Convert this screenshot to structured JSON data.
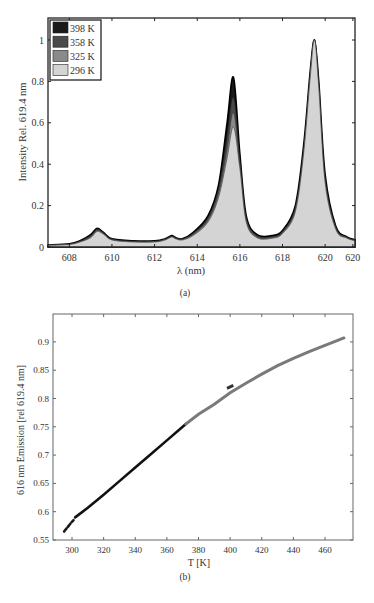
{
  "figure_a": {
    "caption": "(a)",
    "xlabel": "λ (nm)",
    "ylabel": "Intensity Rel. 619.4 nm",
    "xticks": [
      "608",
      "610",
      "612",
      "614",
      "616",
      "618",
      "620",
      "620"
    ],
    "yticks": [
      "0",
      "0.2",
      "0.4",
      "0.6",
      "0.8",
      "1"
    ],
    "legend": [
      {
        "label": "398 K",
        "color": "#1a1a1a"
      },
      {
        "label": "358 K",
        "color": "#4a4a4a"
      },
      {
        "label": "325 K",
        "color": "#8a8a8a"
      },
      {
        "label": "296 K",
        "color": "#d4d4d4"
      }
    ]
  },
  "figure_b": {
    "caption": "(b)",
    "xlabel": "T [K]",
    "ylabel": "616 nm Emission [rel 619.4 nm]",
    "xticks": [
      "300",
      "320",
      "340",
      "360",
      "380",
      "400",
      "420",
      "440",
      "460"
    ],
    "yticks": [
      "0.55",
      "0.6",
      "0.65",
      "0.7",
      "0.75",
      "0.8",
      "0.85",
      "0.9"
    ]
  },
  "chart_data": [
    {
      "type": "area",
      "title": "",
      "xlabel": "λ (nm)",
      "ylabel": "Intensity Rel. 619.4 nm",
      "xlim": [
        607,
        621.4
      ],
      "ylim": [
        0,
        1.1
      ],
      "grid": false,
      "legend_position": "upper-left",
      "x": [
        607,
        608,
        608.5,
        609,
        609.3,
        609.6,
        610,
        611,
        612,
        612.5,
        612.8,
        613,
        613.3,
        613.8,
        614.5,
        615,
        615.4,
        615.7,
        616,
        616.3,
        616.8,
        617.5,
        618,
        618.6,
        619,
        619.3,
        619.5,
        619.7,
        620,
        620.5,
        621,
        621.4
      ],
      "series": [
        {
          "name": "398 K",
          "values": [
            0.01,
            0.015,
            0.03,
            0.06,
            0.09,
            0.07,
            0.04,
            0.03,
            0.03,
            0.04,
            0.055,
            0.045,
            0.04,
            0.07,
            0.15,
            0.3,
            0.6,
            0.82,
            0.45,
            0.15,
            0.06,
            0.055,
            0.08,
            0.2,
            0.5,
            0.85,
            1.0,
            0.8,
            0.35,
            0.1,
            0.05,
            0.035
          ]
        },
        {
          "name": "358 K",
          "values": [
            0.01,
            0.014,
            0.028,
            0.055,
            0.085,
            0.068,
            0.038,
            0.028,
            0.028,
            0.038,
            0.052,
            0.043,
            0.038,
            0.065,
            0.14,
            0.28,
            0.52,
            0.72,
            0.42,
            0.14,
            0.055,
            0.05,
            0.075,
            0.19,
            0.48,
            0.84,
            1.0,
            0.79,
            0.33,
            0.095,
            0.048,
            0.033
          ]
        },
        {
          "name": "325 K",
          "values": [
            0.009,
            0.013,
            0.026,
            0.05,
            0.08,
            0.065,
            0.036,
            0.026,
            0.026,
            0.036,
            0.05,
            0.041,
            0.036,
            0.06,
            0.13,
            0.26,
            0.47,
            0.65,
            0.4,
            0.13,
            0.05,
            0.046,
            0.07,
            0.18,
            0.47,
            0.83,
            1.0,
            0.78,
            0.32,
            0.09,
            0.046,
            0.031
          ]
        },
        {
          "name": "296 K",
          "values": [
            0.008,
            0.012,
            0.024,
            0.045,
            0.075,
            0.062,
            0.034,
            0.024,
            0.024,
            0.034,
            0.048,
            0.039,
            0.034,
            0.055,
            0.12,
            0.24,
            0.43,
            0.58,
            0.38,
            0.12,
            0.045,
            0.042,
            0.065,
            0.17,
            0.46,
            0.82,
            1.0,
            0.77,
            0.31,
            0.085,
            0.044,
            0.03
          ]
        }
      ]
    },
    {
      "type": "line",
      "title": "",
      "xlabel": "T [K]",
      "ylabel": "616 nm Emission [rel 619.4 nm]",
      "xlim": [
        288,
        477
      ],
      "ylim": [
        0.55,
        0.95
      ],
      "grid": false,
      "series": [
        {
          "name": "296 K run (dark, dashed start)",
          "color": "#1a1a1a",
          "x": [
            295,
            297,
            299,
            301
          ],
          "values": [
            0.565,
            0.572,
            0.579,
            0.585
          ]
        },
        {
          "name": "296–372 K (black)",
          "color": "#111111",
          "x": [
            302,
            310,
            320,
            330,
            340,
            350,
            360,
            372
          ],
          "values": [
            0.59,
            0.607,
            0.63,
            0.654,
            0.678,
            0.702,
            0.726,
            0.755
          ]
        },
        {
          "name": "372–472 K (gray)",
          "color": "#7a7a7a",
          "x": [
            372,
            380,
            390,
            400,
            410,
            420,
            430,
            440,
            450,
            460,
            472
          ],
          "values": [
            0.755,
            0.772,
            0.79,
            0.81,
            0.827,
            0.843,
            0.858,
            0.871,
            0.883,
            0.894,
            0.907
          ]
        }
      ]
    }
  ]
}
